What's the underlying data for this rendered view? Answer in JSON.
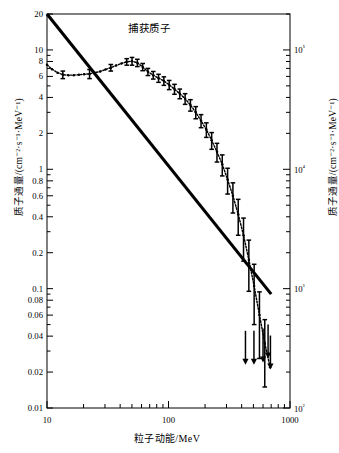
{
  "chart_data": {
    "type": "line",
    "title": "",
    "annotation": "捕获质子",
    "xlabel": "粒子动能/MeV",
    "ylabel_left": "质子通量/(cm⁻²·s⁻¹·MeV⁻¹)",
    "ylabel_right": "质子通量/(cm⁻²·s⁻¹·MeV⁻¹)",
    "xscale": "log",
    "yscale": "log",
    "xlim": [
      10,
      1000
    ],
    "ylim_left": [
      0.01,
      20
    ],
    "ylim_right": [
      100,
      200000
    ],
    "grid": false,
    "legend_position": "none",
    "xticks_major": [
      10,
      100,
      1000
    ],
    "xticklabels_major": [
      "10",
      "100",
      "1000"
    ],
    "xticks_minor": [
      20,
      30,
      40,
      50,
      60,
      70,
      80,
      90,
      200,
      300,
      400,
      500,
      600,
      700,
      800,
      900
    ],
    "yticks_left": [
      20,
      10,
      8,
      6,
      4,
      2,
      1,
      0.8,
      0.6,
      0.4,
      0.2,
      0.1,
      0.08,
      0.06,
      0.04,
      0.02,
      0.01
    ],
    "yticklabels_left": [
      "20",
      "10",
      "8",
      "6",
      "4",
      "2",
      "1",
      "0.8",
      "0.6",
      "0.4",
      "0.2",
      "0.1",
      "0.08",
      "0.06",
      "0.04",
      "0.02",
      "0.01"
    ],
    "yticks_right": [
      100000,
      10000,
      1000,
      100
    ],
    "yticklabels_right": [
      "10⁵",
      "10⁴",
      "10³",
      "10²"
    ],
    "right_axis_scale_factor": 10000,
    "series": [
      {
        "name": "model-line",
        "style": "thick-solid",
        "x": [
          10,
          700
        ],
        "y": [
          20,
          0.09
        ]
      },
      {
        "name": "measured-spectrum",
        "style": "dotted-with-errorbars",
        "x": [
          10.0,
          11.0,
          12.2,
          13.5,
          15.0,
          16.6,
          18.3,
          20.2,
          22.4,
          24.8,
          27.4,
          30.3,
          33.5,
          37.0,
          41.0,
          45.3,
          50.1,
          55.4,
          61.3,
          67.7,
          74.9,
          82.8,
          91.6,
          101.3,
          112.0,
          123.9,
          137.0,
          151.5,
          167.6,
          185.3,
          204.9,
          226.6,
          250.6,
          277.1,
          306.5,
          338.9,
          374.8,
          414.5,
          458.4,
          506.9,
          560.6,
          620.0,
          685.7
        ],
        "y": [
          7.5,
          6.9,
          6.45,
          6.2,
          6.15,
          6.15,
          6.2,
          6.25,
          6.3,
          6.45,
          6.6,
          6.85,
          7.1,
          7.4,
          7.7,
          7.95,
          8.05,
          7.8,
          7.2,
          6.55,
          6.15,
          5.8,
          5.5,
          5.1,
          4.7,
          4.3,
          3.9,
          3.45,
          3.0,
          2.55,
          2.15,
          1.75,
          1.4,
          1.1,
          0.82,
          0.6,
          0.42,
          0.28,
          0.175,
          0.105,
          0.06,
          0.035,
          0.022
        ],
        "yerr_lo": [
          0.0,
          0.0,
          0.0,
          0.45,
          0.0,
          0.0,
          0.0,
          0.0,
          0.55,
          0.0,
          0.0,
          0.0,
          0.45,
          0.0,
          0.0,
          0.5,
          0.6,
          0.55,
          0.5,
          0.45,
          0.45,
          0.45,
          0.45,
          0.45,
          0.45,
          0.4,
          0.4,
          0.38,
          0.35,
          0.32,
          0.3,
          0.28,
          0.25,
          0.22,
          0.2,
          0.17,
          0.14,
          0.11,
          0.08,
          0.055,
          0.034,
          0.02,
          0.0
        ],
        "yerr_hi": [
          0.0,
          0.0,
          0.0,
          0.45,
          0.0,
          0.0,
          0.0,
          0.0,
          0.55,
          0.0,
          0.0,
          0.0,
          0.45,
          0.0,
          0.0,
          0.5,
          0.6,
          0.55,
          0.5,
          0.45,
          0.45,
          0.45,
          0.45,
          0.45,
          0.45,
          0.4,
          0.4,
          0.38,
          0.35,
          0.32,
          0.3,
          0.28,
          0.25,
          0.22,
          0.2,
          0.17,
          0.14,
          0.11,
          0.08,
          0.055,
          0.034,
          0.02,
          0.0
        ]
      },
      {
        "name": "upper-limits",
        "style": "down-arrow",
        "x": [
          430,
          505,
          600,
          660,
          690
        ],
        "y": [
          0.023,
          0.023,
          0.024,
          0.026,
          0.021
        ]
      }
    ]
  }
}
